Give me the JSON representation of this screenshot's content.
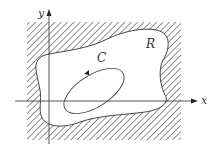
{
  "diagram": {
    "region_label": "R",
    "curve_label": "C",
    "x_axis_label": "x",
    "y_axis_label": "y",
    "colors": {
      "line": "#444444",
      "hatch": "#555555",
      "background": "#ffffff"
    }
  }
}
